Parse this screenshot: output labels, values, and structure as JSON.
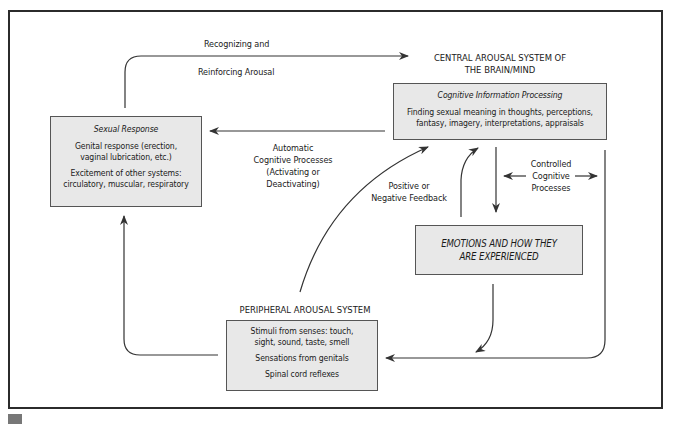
{
  "diagram": {
    "central_heading": [
      "CENTRAL AROUSAL SYSTEM OF",
      "THE BRAIN/MIND"
    ],
    "peripheral_heading": "PERIPHERAL AROUSAL SYSTEM",
    "boxes": {
      "sexual_response": {
        "title": "Sexual Response",
        "lines": [
          "Genital response (erection,",
          "vaginal lubrication, etc.)",
          "Excitement of other systems:",
          "circulatory, muscular, respiratory"
        ]
      },
      "cognitive": {
        "title": "Cognitive Information Processing",
        "lines": [
          "Finding sexual meaning in thoughts, perceptions,",
          "fantasy, imagery, interpretations, appraisals"
        ]
      },
      "emotions": {
        "lines": [
          "EMOTIONS AND HOW THEY",
          "ARE EXPERIENCED"
        ]
      },
      "peripheral": {
        "lines": [
          "Stimuli from senses: touch,",
          "sight, sound, taste, smell",
          "Sensations from genitals",
          "Spinal cord reflexes"
        ]
      }
    },
    "labels": {
      "recognizing": "Recognizing and",
      "reinforcing": "Reinforcing Arousal",
      "automatic": [
        "Automatic",
        "Cognitive Processes",
        "(Activating or",
        "Deactivating)"
      ],
      "feedback": [
        "Positive or",
        "Negative Feedback"
      ],
      "controlled": [
        "Controlled",
        "Cognitive",
        "Processes"
      ]
    },
    "colors": {
      "box_fill": "#e8e8e8",
      "line": "#333333",
      "frame": "#2b2b2b"
    }
  }
}
